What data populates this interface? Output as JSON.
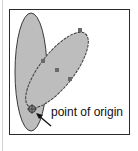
{
  "figure": {
    "label": "point of origin",
    "colors": {
      "frame": "#2a2a2a",
      "ellipse_fill": "#bdbdbd",
      "ellipse_stroke": "#3a3a3a",
      "handle": "#6a6a6a",
      "arrow": "#111111",
      "left_rule": "#d4d4d4"
    },
    "shapes": [
      {
        "name": "upright-ellipse",
        "cx": 31,
        "cy": 73,
        "rx": 16,
        "ry": 60,
        "rotate": 0
      },
      {
        "name": "rotated-ellipse",
        "cx": 57,
        "cy": 69,
        "rx": 18,
        "ry": 45,
        "rotate": 38
      }
    ],
    "handles": [
      {
        "x": 43,
        "y": 61
      },
      {
        "x": 57,
        "y": 70
      },
      {
        "x": 70,
        "y": 79
      },
      {
        "x": 80,
        "y": 30
      }
    ],
    "origin_point": {
      "x": 32,
      "y": 109
    },
    "arrow": {
      "from": {
        "x": 51,
        "y": 126
      },
      "to": {
        "x": 37,
        "y": 114
      }
    }
  }
}
